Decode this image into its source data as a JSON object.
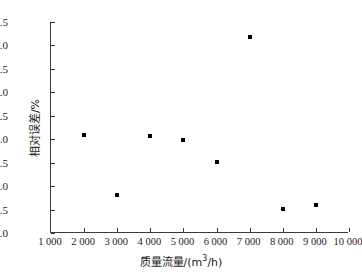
{
  "chart_data": {
    "type": "scatter",
    "title": "",
    "xlabel": "质量流量/(m³/h)",
    "ylabel": "相对误差/%",
    "xlim": [
      1000,
      10000
    ],
    "ylim": [
      -2.0,
      2.5
    ],
    "grid": false,
    "legend": null,
    "marker": {
      "shape": "square",
      "color": "#000000",
      "size_px": 4
    },
    "x_tick_labels": [
      "1 000",
      "2 000",
      "3 000",
      "4 000",
      "5 000",
      "6 000",
      "7 000",
      "8 000",
      "9 000",
      "10 000"
    ],
    "x_ticks": [
      1000,
      2000,
      3000,
      4000,
      5000,
      6000,
      7000,
      8000,
      9000,
      10000
    ],
    "y_tick_labels": [
      "2.5",
      "2.0",
      "1.5",
      "1.0",
      "0.5",
      "0.0",
      "–0.5",
      "–1.0",
      "–1.5",
      "–2.0"
    ],
    "y_ticks": [
      2.5,
      2.0,
      1.5,
      1.0,
      0.5,
      0.0,
      -0.5,
      -1.0,
      -1.5,
      -2.0
    ],
    "x": [
      2000,
      3000,
      4000,
      5000,
      6000,
      7000,
      8000,
      9000
    ],
    "values": [
      0.1,
      -1.2,
      0.07,
      -0.02,
      -0.49,
      2.18,
      -1.49,
      -1.4
    ],
    "points": [
      {
        "x": 2000,
        "y": 0.1
      },
      {
        "x": 3000,
        "y": -1.2
      },
      {
        "x": 4000,
        "y": 0.07
      },
      {
        "x": 5000,
        "y": -0.02
      },
      {
        "x": 6000,
        "y": -0.49
      },
      {
        "x": 7000,
        "y": 2.18
      },
      {
        "x": 8000,
        "y": -1.49
      },
      {
        "x": 9000,
        "y": -1.4
      }
    ]
  },
  "axis_label_parts": {
    "x_prefix": "质量流量/(m",
    "x_sup": "3",
    "x_suffix": "/h)"
  }
}
